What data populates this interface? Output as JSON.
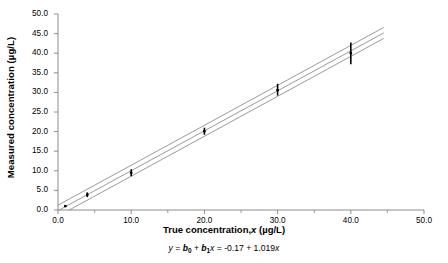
{
  "chart_data": {
    "type": "scatter",
    "title": "",
    "xlabel": "True concentration, x (µg/L)",
    "ylabel": "Measured concentration (µg/L)",
    "xlim": [
      0.0,
      50.0
    ],
    "ylim": [
      0.0,
      50.0
    ],
    "grid": false,
    "legend": null,
    "x_ticks": [
      0.0,
      10.0,
      20.0,
      30.0,
      40.0,
      50.0
    ],
    "x_tick_labels": [
      "0.0",
      "10.0",
      "20.0",
      "30.0",
      "40.0",
      "50.0"
    ],
    "x_minor_ticks": [
      5.0,
      15.0,
      25.0,
      35.0,
      45.0
    ],
    "y_ticks": [
      0.0,
      5.0,
      10.0,
      15.0,
      20.0,
      25.0,
      30.0,
      35.0,
      40.0,
      45.0,
      50.0
    ],
    "y_tick_labels": [
      "0.0",
      "5.0",
      "10.0",
      "15.0",
      "20.0",
      "25.0",
      "30.0",
      "35.0",
      "40.0",
      "45.0",
      "50.0"
    ],
    "points": [
      {
        "x": 1.0,
        "y": 1.0,
        "yerr_low": 0.7,
        "yerr_high": 1.3
      },
      {
        "x": 4.0,
        "y": 3.9,
        "yerr_low": 3.3,
        "yerr_high": 4.5
      },
      {
        "x": 10.0,
        "y": 9.5,
        "yerr_low": 8.6,
        "yerr_high": 10.4
      },
      {
        "x": 20.0,
        "y": 20.1,
        "yerr_low": 19.2,
        "yerr_high": 21.0
      },
      {
        "x": 30.0,
        "y": 30.6,
        "yerr_low": 29.2,
        "yerr_high": 32.2
      },
      {
        "x": 40.0,
        "y": 40.0,
        "yerr_low": 37.2,
        "yerr_high": 42.7
      }
    ],
    "fit": {
      "intercept": -0.17,
      "slope": 1.019,
      "equation_prefix": "y = b",
      "equation_sub0": "0",
      "equation_mid": " + b",
      "equation_sub1": "1",
      "equation_var": "x",
      "equation_eq": " = -0.17 + 1.019",
      "equation_tail": "x",
      "equation_text": "y = b0 + b1x = -0.17 + 1.019x"
    },
    "confidence_band": {
      "offset": 1.4,
      "description": "upper and lower confidence limit lines parallel to regression line"
    },
    "colors": {
      "line": "#808080",
      "marker": "#000000",
      "axis": "#808080",
      "text": "#000000",
      "background": "#ffffff"
    }
  },
  "axis": {
    "y_title": "Measured concentration (µg/L)",
    "x_title_main": "True concentration,",
    "x_title_var": "x",
    "x_title_unit": "(µg/L)"
  }
}
